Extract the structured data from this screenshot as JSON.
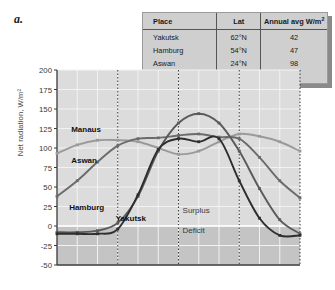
{
  "figure": {
    "letter": "a."
  },
  "table": {
    "headers": [
      "Place",
      "Lat",
      "Annual avg W/m"
    ],
    "header_superscript": "2",
    "rows": [
      {
        "place": "Yakutsk",
        "lat": "62°N",
        "avg": "42"
      },
      {
        "place": "Hamburg",
        "lat": "54°N",
        "avg": "47"
      },
      {
        "place": "Aswan",
        "lat": "24°N",
        "avg": "98"
      },
      {
        "place": "Manaus",
        "lat": "3°S",
        "avg": "87"
      }
    ]
  },
  "chart_data": {
    "type": "line",
    "title": "",
    "xlabel": "",
    "ylabel": "Net radiation, W/m²",
    "ylim": [
      -50,
      200
    ],
    "ytick_labels": [
      "200",
      "175",
      "150",
      "125",
      "100",
      "75",
      "50",
      "25",
      "0",
      "-25",
      "-50"
    ],
    "ytick_values": [
      200,
      175,
      150,
      125,
      100,
      75,
      50,
      25,
      0,
      -25,
      -50
    ],
    "xlim": [
      0,
      12
    ],
    "xtick_labels": [],
    "grid": true,
    "gridline_months": [
      3,
      6,
      9,
      12
    ],
    "zero_line": 0,
    "legend_position": "inline-curve-labels",
    "annotations": [
      {
        "text": "Surplus",
        "value": 18,
        "month": 6.2
      },
      {
        "text": "Deficit",
        "value": -8,
        "month": 6.2
      }
    ],
    "x": [
      0,
      1,
      2,
      3,
      4,
      5,
      6,
      7,
      8,
      9,
      10,
      11,
      12
    ],
    "series": [
      {
        "name": "Manaus",
        "color": "#9a9a9a",
        "label_month": 0.7,
        "label_value": 122,
        "values": [
          93,
          104,
          110,
          110,
          108,
          100,
          92,
          96,
          108,
          118,
          115,
          108,
          96
        ]
      },
      {
        "name": "Aswan",
        "color": "#6b6b6b",
        "label_month": 0.7,
        "label_value": 82,
        "values": [
          38,
          58,
          82,
          103,
          112,
          113,
          116,
          118,
          114,
          112,
          88,
          58,
          36
        ]
      },
      {
        "name": "Hamburg",
        "color": "#5a5a5a",
        "label_month": 0.6,
        "label_value": 22,
        "values": [
          -8,
          -8,
          -6,
          4,
          38,
          96,
          132,
          144,
          132,
          96,
          48,
          8,
          -10
        ]
      },
      {
        "name": "Yakutsk",
        "color": "#2e2e2e",
        "label_month": 2.9,
        "label_value": 8,
        "values": [
          -10,
          -10,
          -10,
          -4,
          40,
          98,
          112,
          108,
          112,
          58,
          10,
          -12,
          -12
        ]
      }
    ]
  }
}
